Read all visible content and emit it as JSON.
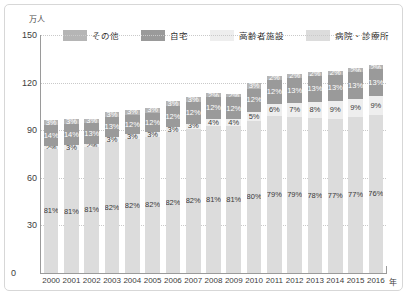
{
  "chart_data": {
    "type": "bar",
    "stacked": true,
    "title": "",
    "subtitle": "",
    "xlabel": "年",
    "ylabel": "万人",
    "ylim": [
      0,
      150
    ],
    "yticks": [
      0,
      30,
      60,
      90,
      120,
      150
    ],
    "grid": true,
    "legend_position": "top",
    "categories": [
      "2000",
      "2001",
      "2002",
      "2003",
      "2004",
      "2005",
      "2006",
      "2007",
      "2008",
      "2009",
      "2010",
      "2011",
      "2012",
      "2013",
      "2014",
      "2015",
      "2016"
    ],
    "totals": [
      96.2,
      97.0,
      98.2,
      101.5,
      102.9,
      104.3,
      108.4,
      110.8,
      114.3,
      114.1,
      119.7,
      125.3,
      125.6,
      126.8,
      127.3,
      129.0,
      131.0
    ],
    "series": [
      {
        "name": "病院・診療所",
        "color": "#dcdcdc",
        "values": [
          81,
          81,
          81,
          82,
          82,
          82,
          82,
          82,
          81,
          81,
          80,
          79,
          79,
          78,
          77,
          77,
          76
        ],
        "labels": [
          "81%",
          "81%",
          "81%",
          "82%",
          "82%",
          "82%",
          "82%",
          "82%",
          "81%",
          "81%",
          "80%",
          "79%",
          "79%",
          "78%",
          "77%",
          "77%",
          "76%"
        ]
      },
      {
        "name": "高齢者施設",
        "color": "#eeeeee",
        "values": [
          2,
          3,
          2,
          3,
          3,
          3,
          3,
          3,
          4,
          4,
          5,
          6,
          7,
          8,
          9,
          9,
          9
        ],
        "labels": [
          "2%",
          "3%",
          "2%",
          "3%",
          "3%",
          "3%",
          "3%",
          "3%",
          "4%",
          "4%",
          "5%",
          "6%",
          "7%",
          "8%",
          "9%",
          "9%",
          "9%"
        ]
      },
      {
        "name": "自宅",
        "color": "#9a9a9a",
        "values": [
          14,
          14,
          13,
          13,
          12,
          12,
          12,
          12,
          12,
          12,
          12,
          12,
          13,
          13,
          13,
          13,
          13
        ],
        "labels": [
          "14%",
          "14%",
          "13%",
          "13%",
          "12%",
          "12%",
          "12%",
          "12%",
          "12%",
          "12%",
          "12%",
          "12%",
          "13%",
          "13%",
          "13%",
          "13%",
          "13%"
        ]
      },
      {
        "name": "その他",
        "color": "#b5b5b5",
        "values": [
          3,
          3,
          3,
          3,
          3,
          3,
          3,
          3,
          2,
          2,
          3,
          2,
          2,
          2,
          2,
          2,
          2
        ],
        "labels": [
          "3%",
          "3%",
          "3%",
          "3%",
          "3%",
          "3%",
          "3%",
          "3%",
          "2%",
          "2%",
          "3%",
          "2%",
          "2%",
          "2%",
          "2%",
          "2%",
          "2%"
        ]
      }
    ]
  },
  "axis": {
    "unit_label": "万人",
    "x_unit_label": "年",
    "y_ticks": [
      "150",
      "120",
      "90",
      "60",
      "30",
      "0"
    ]
  },
  "legend": {
    "items": [
      {
        "label": "その他",
        "color": "#b5b5b5"
      },
      {
        "label": "自宅",
        "color": "#9a9a9a"
      },
      {
        "label": "高齢者施設",
        "color": "#eeeeee"
      },
      {
        "label": "病院・診療所",
        "color": "#dcdcdc"
      }
    ]
  }
}
